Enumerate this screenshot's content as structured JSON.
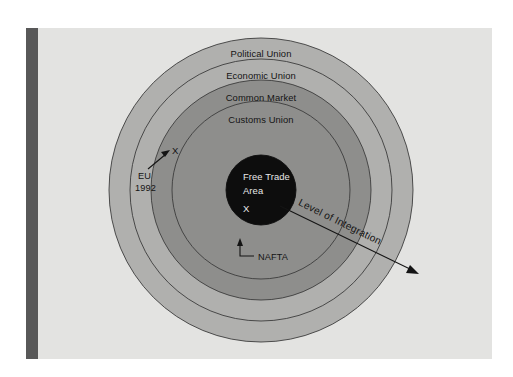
{
  "figure": {
    "type": "concentric-rings-diagram",
    "background_color": "#e3e3e1",
    "spine_color": "#585858"
  },
  "rings": [
    {
      "label": "Political Union",
      "level": 5,
      "fill": "#b0b0ae",
      "stroke": "#3c3c3c",
      "outer_radius": 152,
      "label_y_offset": -136
    },
    {
      "label": "Economic Union",
      "level": 4,
      "fill": "#b0b0ae",
      "stroke": "#3c3c3c",
      "outer_radius": 131,
      "label_y_offset": -114
    },
    {
      "label": "Common Market",
      "level": 3,
      "fill": "#8e8e8c",
      "stroke": "#3c3c3c",
      "outer_radius": 110,
      "label_y_offset": -92
    },
    {
      "label": "Customs Union",
      "level": 2,
      "fill": "#8e8e8c",
      "stroke": "#3c3c3c",
      "outer_radius": 89,
      "label_y_offset": -70
    }
  ],
  "core": {
    "label_line1": "Free Trade",
    "label_line2": "Area",
    "marker": "X",
    "level": 1,
    "fill": "#0d0d0d",
    "radius": 35,
    "text_color": "#e8e8e8"
  },
  "annotations": [
    {
      "name": "nafta",
      "label": "NAFTA",
      "points_to": "Free Trade Area",
      "marker": "X"
    },
    {
      "name": "eu-1992",
      "label_line1": "EU",
      "label_line2": "1992",
      "points_to": "Economic Union",
      "marker": "X"
    },
    {
      "name": "level-of-integration-axis",
      "label": "Level of Integration",
      "direction": "outward"
    }
  ],
  "colors": {
    "outer_ring": "#b0b0ae",
    "inner_ring": "#8e8e8c",
    "core": "#0d0d0d",
    "page": "#e3e3e1",
    "spine": "#585858",
    "stroke": "#3c3c3c"
  }
}
